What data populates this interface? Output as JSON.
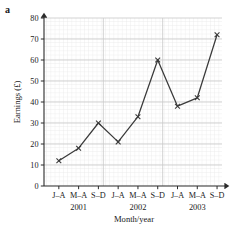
{
  "figure": {
    "panel_letter": "a"
  },
  "chart_data": {
    "type": "line",
    "title": "",
    "xlabel": "Month/year",
    "ylabel": "Earnings (£)",
    "ylim": [
      0,
      80
    ],
    "ytick_values": [
      0,
      10,
      20,
      30,
      40,
      50,
      60,
      70,
      80
    ],
    "ytick_labels": [
      "0",
      "10",
      "20",
      "30",
      "40",
      "50",
      "60",
      "70",
      "80"
    ],
    "categories": [
      "J–A",
      "M–A",
      "S–D",
      "J–A",
      "M–A",
      "S–D",
      "J–A",
      "M–A",
      "S–D"
    ],
    "group_labels": [
      "2001",
      "2002",
      "2003"
    ],
    "values": [
      12,
      18,
      30,
      21,
      33,
      60,
      38,
      42,
      72
    ],
    "marker": "x",
    "grid": true,
    "legend": false,
    "line_color": "#3a3a3a",
    "marker_color": "#3a3a3a",
    "major_grid_color": "#c8c8c8",
    "minor_grid_color": "#e4e4e4",
    "axis_color": "#2b2b2b"
  }
}
